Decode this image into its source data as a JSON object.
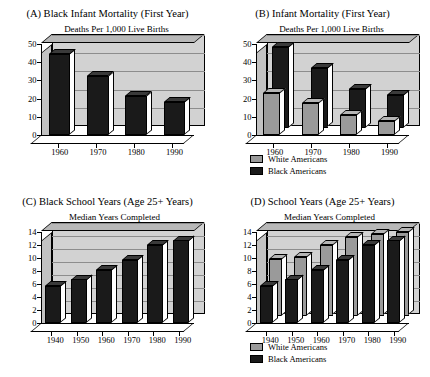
{
  "figure": {
    "panels": [
      {
        "id": "A",
        "title": "(A) Black Infant Mortality (First Year)",
        "subtitle": "Deaths Per 1,000 Live Births",
        "has_legend": false
      },
      {
        "id": "B",
        "title": "(B) Infant Mortality (First Year)",
        "subtitle": "Deaths Per 1,000 Live Births",
        "has_legend": true
      },
      {
        "id": "C",
        "title": "(C) Black School Years (Age 25+ Years)",
        "subtitle": "Median Years Completed",
        "has_legend": false
      },
      {
        "id": "D",
        "title": "(D) School Years (Age 25+ Years)",
        "subtitle": "Median Years Completed",
        "has_legend": true
      }
    ],
    "legend": {
      "white_label": "White Americans",
      "black_label": "Black Americans",
      "white_color": "#9a9a9a",
      "black_color": "#1a1a1a"
    }
  },
  "chart_data": [
    {
      "type": "bar",
      "panel": "A",
      "title": "(A) Black Infant Mortality (First Year)",
      "subtitle": "Deaths Per 1,000 Live Births",
      "xlabel": "",
      "ylabel": "Deaths Per 1,000 Live Births",
      "categories": [
        "1960",
        "1970",
        "1980",
        "1990"
      ],
      "yticks": [
        0,
        10,
        20,
        30,
        40,
        50
      ],
      "ylim": [
        0,
        50
      ],
      "grid": true,
      "legend_position": "none",
      "series": [
        {
          "name": "Black Americans",
          "color": "#1a1a1a",
          "values": [
            44.3,
            32.6,
            21.4,
            18.0
          ]
        }
      ]
    },
    {
      "type": "bar",
      "panel": "B",
      "title": "(B) Infant Mortality (First Year)",
      "subtitle": "Deaths Per 1,000 Live Births",
      "xlabel": "",
      "ylabel": "Deaths Per 1,000 Live Births",
      "categories": [
        "1960",
        "1970",
        "1980",
        "1990"
      ],
      "yticks": [
        0,
        10,
        20,
        30,
        40,
        50
      ],
      "ylim": [
        0,
        50
      ],
      "grid": true,
      "legend_position": "bottom-left",
      "series": [
        {
          "name": "White Americans",
          "color": "#9a9a9a",
          "values": [
            22.9,
            17.8,
            11.0,
            7.6
          ]
        },
        {
          "name": "Black Americans",
          "color": "#1a1a1a",
          "values": [
            44.3,
            32.6,
            21.4,
            18.0
          ]
        }
      ]
    },
    {
      "type": "bar",
      "panel": "C",
      "title": "(C) Black School Years (Age 25+ Years)",
      "subtitle": "Median Years Completed",
      "xlabel": "",
      "ylabel": "Median Years Completed",
      "categories": [
        "1940",
        "1950",
        "1960",
        "1970",
        "1980",
        "1990"
      ],
      "yticks": [
        0,
        2,
        4,
        6,
        8,
        10,
        12,
        14
      ],
      "ylim": [
        0,
        14
      ],
      "grid": true,
      "legend_position": "none",
      "series": [
        {
          "name": "Black Americans",
          "color": "#1a1a1a",
          "values": [
            5.7,
            6.7,
            8.2,
            9.7,
            12.0,
            12.7
          ]
        }
      ]
    },
    {
      "type": "bar",
      "panel": "D",
      "title": "(D) School Years (Age 25+ Years)",
      "subtitle": "Median Years Completed",
      "xlabel": "",
      "ylabel": "Median Years Completed",
      "categories": [
        "1940",
        "1950",
        "1960",
        "1970",
        "1980",
        "1990"
      ],
      "yticks": [
        0,
        2,
        4,
        6,
        8,
        10,
        12,
        14
      ],
      "ylim": [
        0,
        14
      ],
      "grid": true,
      "legend_position": "bottom-left",
      "series": [
        {
          "name": "White Americans",
          "color": "#9a9a9a",
          "values": [
            8.7,
            9.0,
            10.8,
            12.1,
            12.5,
            12.8
          ]
        },
        {
          "name": "Black Americans",
          "color": "#1a1a1a",
          "values": [
            5.7,
            6.7,
            8.2,
            9.7,
            12.0,
            12.7
          ]
        }
      ]
    }
  ]
}
